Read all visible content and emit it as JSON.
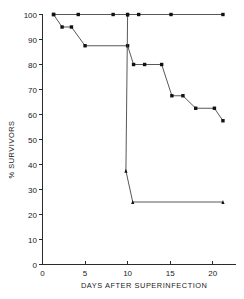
{
  "chart_data": {
    "type": "line",
    "title": "",
    "subtitle": "",
    "xlabel": "DAYS  AFTER  SUPERINFECTION",
    "ylabel": "% SURVIVORS",
    "xlim": [
      0,
      22.5
    ],
    "ylim": [
      0,
      100
    ],
    "xticks": [
      0,
      5,
      10,
      15,
      20
    ],
    "xtick_labels": [
      "0",
      "5",
      "10",
      "15",
      "20"
    ],
    "yticks": [
      0,
      10,
      20,
      30,
      40,
      50,
      60,
      70,
      80,
      90,
      100
    ],
    "ytick_labels": [
      "0",
      "10",
      "20",
      "30",
      "40",
      "50",
      "60",
      "70",
      "80",
      "90",
      "100"
    ],
    "grid": false,
    "legend": "none",
    "series": [
      {
        "name": "100% survival group",
        "marker": "square",
        "x": [
          1.3,
          4.2,
          8.3,
          10.0,
          11.3,
          15.1,
          21.2
        ],
        "values": [
          100,
          100,
          100,
          100,
          100,
          100,
          100
        ]
      },
      {
        "name": "gradual decline group",
        "marker": "square",
        "x": [
          1.3,
          2.3,
          3.4,
          5.0,
          10.0,
          10.7,
          12.0,
          14.0,
          15.2,
          16.5,
          18.0,
          20.2,
          21.2
        ],
        "values": [
          100,
          95,
          95,
          87.5,
          87.5,
          80,
          80,
          80,
          67.5,
          67.5,
          62.5,
          62.5,
          57.5
        ]
      },
      {
        "name": "rapid decline group",
        "marker": "triangle",
        "x": [
          10.0,
          9.8,
          10.6,
          21.2
        ],
        "values": [
          100,
          37.5,
          25,
          25
        ]
      }
    ]
  }
}
